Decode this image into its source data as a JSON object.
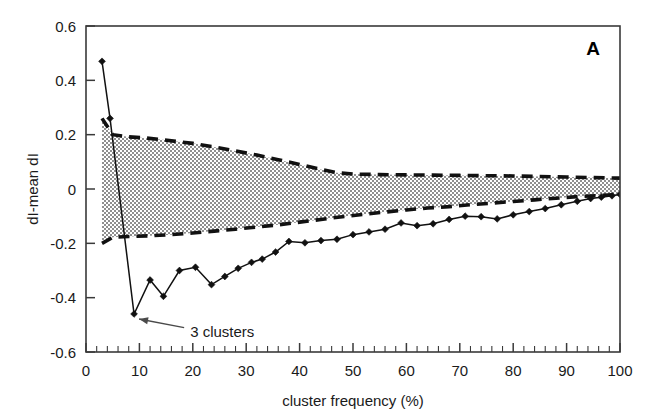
{
  "figure": {
    "panel_label": "A",
    "background_color": "#ffffff",
    "line_color": "#111111",
    "band_fill_color": "#9a9a9a"
  },
  "annotations": [
    {
      "name": "three-clusters-annotation",
      "text": "3 clusters",
      "target_x": 9,
      "target_y": -0.46,
      "text_x": 19.5,
      "text_y": -0.525
    }
  ],
  "chart_data": {
    "type": "line",
    "title": "",
    "subtitle": "",
    "xlabel": "cluster frequency (%)",
    "ylabel": "dI-mean dI",
    "xlim": [
      0,
      100
    ],
    "ylim": [
      -0.6,
      0.6
    ],
    "xticks": [
      0,
      10,
      20,
      30,
      40,
      50,
      60,
      70,
      80,
      90,
      100
    ],
    "xtick_labels": [
      "0",
      "10",
      "20",
      "30",
      "40",
      "50",
      "60",
      "70",
      "80",
      "90",
      "100"
    ],
    "yticks": [
      -0.6,
      -0.4,
      -0.2,
      0,
      0.2,
      0.4,
      0.6
    ],
    "ytick_labels": [
      "-0.6",
      "-0.4",
      "-0.2",
      "0",
      "0.2",
      "0.4",
      "0.6"
    ],
    "x_minor_tick_interval": 2,
    "grid": false,
    "legend_position": "none",
    "series": [
      {
        "name": "dI-mean dI",
        "style": "solid-line-with-diamond-markers",
        "marker": "diamond",
        "x": [
          3,
          4.5,
          9,
          12,
          14.5,
          17.5,
          20.5,
          23.5,
          26,
          28.5,
          31,
          33,
          35.5,
          38,
          41,
          44,
          47,
          50,
          53,
          56,
          59,
          62,
          65,
          68,
          71,
          74,
          77,
          80,
          83,
          86,
          89,
          92,
          94.5,
          96.5,
          98.5,
          100
        ],
        "y": [
          0.47,
          0.26,
          -0.46,
          -0.335,
          -0.395,
          -0.3,
          -0.288,
          -0.352,
          -0.322,
          -0.292,
          -0.27,
          -0.258,
          -0.232,
          -0.193,
          -0.198,
          -0.19,
          -0.185,
          -0.168,
          -0.158,
          -0.148,
          -0.125,
          -0.135,
          -0.128,
          -0.112,
          -0.1,
          -0.102,
          -0.11,
          -0.095,
          -0.083,
          -0.072,
          -0.058,
          -0.045,
          -0.035,
          -0.03,
          -0.025,
          -0.02
        ]
      },
      {
        "name": "upper confidence envelope",
        "style": "dashed-line",
        "marker": "none",
        "x": [
          3,
          5,
          8,
          11,
          14,
          17,
          20,
          24,
          28,
          32,
          36,
          40,
          44,
          47,
          50,
          55,
          60,
          65,
          70,
          75,
          80,
          85,
          90,
          95,
          100
        ],
        "y": [
          0.26,
          0.2,
          0.192,
          0.188,
          0.182,
          0.175,
          0.168,
          0.155,
          0.14,
          0.125,
          0.108,
          0.09,
          0.072,
          0.06,
          0.055,
          0.053,
          0.052,
          0.051,
          0.05,
          0.049,
          0.048,
          0.046,
          0.044,
          0.042,
          0.04
        ]
      },
      {
        "name": "lower confidence envelope",
        "style": "dashed-line",
        "marker": "none",
        "x": [
          3,
          5,
          8,
          12,
          16,
          20,
          24,
          28,
          32,
          36,
          40,
          44,
          48,
          52,
          56,
          60,
          64,
          68,
          72,
          76,
          80,
          84,
          88,
          92,
          96,
          100
        ],
        "y": [
          -0.2,
          -0.178,
          -0.175,
          -0.172,
          -0.168,
          -0.162,
          -0.155,
          -0.148,
          -0.14,
          -0.132,
          -0.122,
          -0.112,
          -0.102,
          -0.093,
          -0.085,
          -0.077,
          -0.07,
          -0.065,
          -0.058,
          -0.052,
          -0.046,
          -0.04,
          -0.034,
          -0.028,
          -0.024,
          -0.02
        ]
      }
    ],
    "shaded_band": {
      "name": "confidence-band",
      "between": [
        "upper confidence envelope",
        "lower confidence envelope"
      ],
      "fill_pattern": "stipple"
    }
  }
}
